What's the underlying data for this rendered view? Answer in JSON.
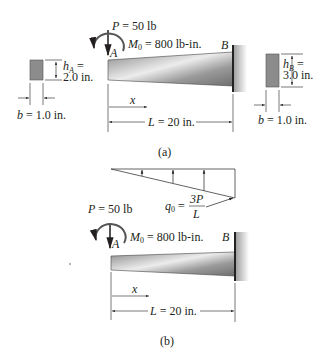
{
  "figure_a": {
    "caption": "(a)",
    "load": {
      "symbol": "P",
      "eq": " = 50 lb"
    },
    "moment": {
      "symbol": "M",
      "sub": "0",
      "eq": " = 800 lb-in."
    },
    "point_a": "A",
    "point_b": "B",
    "x_label": "x",
    "length": {
      "symbol": "L",
      "eq": " = 20 in."
    },
    "section_a": {
      "h_symbol": "h",
      "h_sub": "A",
      "h_eq": " =",
      "h_value": "2.0 in.",
      "b_symbol": "b",
      "b_eq": " = 1.0 in."
    },
    "section_b": {
      "h_symbol": "h",
      "h_sub": "B",
      "h_eq": " =",
      "h_value": "3.0 in.",
      "b_symbol": "b",
      "b_eq": " = 1.0 in."
    }
  },
  "figure_b": {
    "caption": "(b)",
    "load": {
      "symbol": "P",
      "eq": " = 50 lb"
    },
    "moment": {
      "symbol": "M",
      "sub": "0",
      "eq": " = 800 lb-in."
    },
    "point_a": "A",
    "point_b": "B",
    "x_label": "x",
    "length": {
      "symbol": "L",
      "eq": " = 20 in."
    },
    "distributed_load": {
      "symbol": "q",
      "sub": "0",
      "eq": " =",
      "numerator": "3P",
      "denominator": "L"
    }
  },
  "colors": {
    "ink": "#231f20",
    "section_fill": "#8c8c8c",
    "beam_dark": "#7a7a7a",
    "beam_light": "#e6e6e6",
    "wall": "#3a3a3a"
  }
}
